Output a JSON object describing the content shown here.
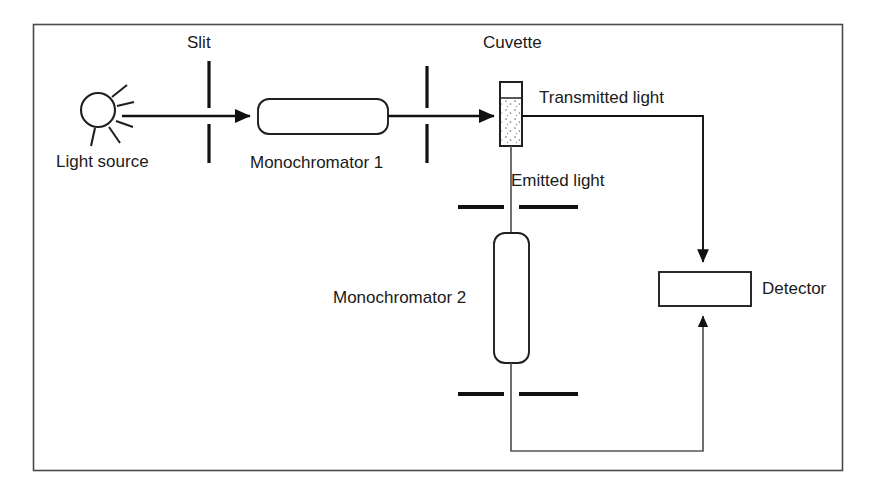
{
  "diagram": {
    "frame": {
      "x": 33,
      "y": 24,
      "width": 810,
      "height": 447,
      "border_color": "#4a4a4a"
    },
    "line_color": "#1f1f1f",
    "background_color": "#ffffff",
    "labels": {
      "light_source": "Light source",
      "slit": "Slit",
      "monochromator_1": "Monochromator 1",
      "cuvette": "Cuvette",
      "transmitted_light": "Transmitted light",
      "emitted_light": "Emitted light",
      "monochromator_2": "Monochromator 2",
      "detector": "Detector"
    },
    "components": [
      {
        "name": "light-source",
        "label": "Light source",
        "type": "sun-symbol",
        "cx": 98,
        "cy": 110,
        "r": 17
      },
      {
        "name": "slit-1",
        "label": "Slit",
        "type": "vertical-slit",
        "x": 209,
        "y_top": 60,
        "y_bottom": 162,
        "gap_top": 108,
        "gap_bottom": 124
      },
      {
        "name": "monochromator-1",
        "label": "Monochromator 1",
        "type": "rounded-box-horizontal",
        "x": 258,
        "y": 99,
        "width": 130,
        "height": 35
      },
      {
        "name": "slit-2",
        "label": "",
        "type": "vertical-slit",
        "x": 427,
        "y_top": 66,
        "y_bottom": 162,
        "gap_top": 108,
        "gap_bottom": 124
      },
      {
        "name": "cuvette",
        "label": "Cuvette",
        "type": "cuvette",
        "x": 500,
        "y": 82,
        "width": 22,
        "height": 64,
        "liquid_top_offset": 16
      },
      {
        "name": "slit-3",
        "label": "",
        "type": "horizontal-slit",
        "y": 207,
        "x_left": 458,
        "x_right": 578,
        "gap_left": 505,
        "gap_right": 518
      },
      {
        "name": "monochromator-2",
        "label": "Monochromator 2",
        "type": "rounded-box-vertical",
        "x": 494,
        "y": 233,
        "width": 35,
        "height": 130
      },
      {
        "name": "slit-4",
        "label": "",
        "type": "horizontal-slit",
        "y": 394,
        "x_left": 458,
        "x_right": 578,
        "gap_left": 505,
        "gap_right": 518
      },
      {
        "name": "detector",
        "label": "Detector",
        "type": "box",
        "x": 659,
        "y": 272,
        "width": 92,
        "height": 34
      }
    ],
    "beams": [
      {
        "name": "source-to-monochromator-1",
        "label": "",
        "arrow": true,
        "points": "122,116 256,116"
      },
      {
        "name": "monochromator-1-to-cuvette",
        "label": "",
        "arrow": true,
        "points": "388,116 498,116"
      },
      {
        "name": "transmitted-light-beam",
        "label": "Transmitted light",
        "arrow": true,
        "points": "522,116 703,116 703,266"
      },
      {
        "name": "emitted-light-beam",
        "label": "Emitted light",
        "arrow": false,
        "points": "511,146 511,233"
      },
      {
        "name": "monochromator-2-out",
        "label": "",
        "arrow": true,
        "points": "511,363 511,451 703,451 703,312"
      }
    ]
  }
}
